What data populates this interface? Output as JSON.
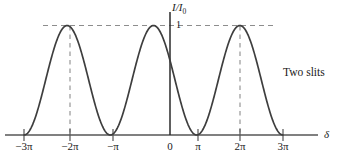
{
  "figure": {
    "title": "",
    "annotation": "Two slits",
    "y_axis_label_main": "I/I",
    "y_axis_label_sub": "0",
    "y_value_label": "1",
    "x_axis_label": "δ"
  },
  "chart_data": {
    "type": "line",
    "title": "",
    "subtitle": "",
    "annotations": [
      "Two slits"
    ],
    "xlabel": "δ",
    "ylabel": "I/I₀",
    "xlim": [
      -3.4159,
      3.4159
    ],
    "ylim": [
      0,
      1.12
    ],
    "grid": false,
    "legend": null,
    "x_tick_labels": [
      "−3π",
      "−2π",
      "−π",
      "0",
      "π",
      "2π",
      "3π"
    ],
    "x_tick_values": [
      -3,
      -2,
      -1,
      0,
      1,
      2,
      3
    ],
    "x_tick_unit": "π",
    "y_tick_labels": [
      "1"
    ],
    "y_tick_values": [
      1
    ],
    "series": [
      {
        "name": "Two-slit intensity",
        "formula": "I/I0 = cos^2(delta/2)",
        "x_unit": "pi",
        "x": [
          -3.0,
          -2.9,
          -2.8,
          -2.7,
          -2.6,
          -2.5,
          -2.4,
          -2.3,
          -2.2,
          -2.1,
          -2.0,
          -1.9,
          -1.8,
          -1.7,
          -1.6,
          -1.5,
          -1.4,
          -1.3,
          -1.2,
          -1.1,
          -1.0,
          -0.9,
          -0.8,
          -0.7,
          -0.6,
          -0.5,
          -0.4,
          -0.3,
          -0.2,
          -0.1,
          0.0,
          0.1,
          0.2,
          0.3,
          0.4,
          0.5,
          0.6,
          0.7,
          0.8,
          0.9,
          1.0,
          1.1,
          1.2,
          1.3,
          1.4,
          1.5,
          1.6,
          1.7,
          1.8,
          1.9,
          2.0,
          2.1,
          2.2,
          2.3,
          2.4,
          2.5,
          2.6,
          2.7,
          2.8,
          2.9,
          3.0
        ],
        "y": [
          0.0,
          0.0245,
          0.0955,
          0.2061,
          0.3455,
          0.5,
          0.6545,
          0.7939,
          0.9045,
          0.9755,
          1.0,
          0.9755,
          0.9045,
          0.7939,
          0.6545,
          0.5,
          0.3455,
          0.2061,
          0.0955,
          0.0245,
          0.0,
          0.0245,
          0.0955,
          0.2061,
          0.3455,
          0.5,
          0.6545,
          0.7939,
          0.9045,
          0.9755,
          1.0,
          0.9755,
          0.9045,
          0.7939,
          0.6545,
          0.5,
          0.3455,
          0.2061,
          0.0955,
          0.0245,
          0.0,
          0.0245,
          0.0955,
          0.2061,
          0.3455,
          0.5,
          0.6545,
          0.7939,
          0.9045,
          0.9755,
          1.0,
          0.9755,
          0.9045,
          0.7939,
          0.6545,
          0.5,
          0.3455,
          0.2061,
          0.0955,
          0.0245,
          0.0
        ]
      }
    ],
    "maxima_x": [
      -2,
      0,
      2
    ],
    "minima_x": [
      -3,
      -1,
      1,
      3
    ],
    "guide_lines": {
      "horizontal_dashed_y": 1,
      "vertical_dashed_x": [
        -2,
        2
      ]
    },
    "colors": {
      "curve": "#3a3a3a",
      "axis": "#4d4d4d",
      "dashed": "#8a8a8a",
      "text": "#1a1a1a"
    }
  },
  "ticks": [
    {
      "label": "−3π",
      "x_px": 24
    },
    {
      "label": "−2π",
      "x_px": 70
    },
    {
      "label": "−π",
      "x_px": 113
    },
    {
      "label": "0",
      "x_px": 170
    },
    {
      "label": "π",
      "x_px": 198
    },
    {
      "label": "2π",
      "x_px": 240
    },
    {
      "label": "3π",
      "x_px": 283
    }
  ]
}
